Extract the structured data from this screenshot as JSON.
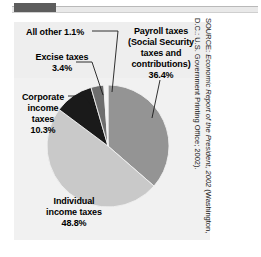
{
  "figure": {
    "panel_bg": "#f1f1f1",
    "source_line_1_prefix": "SOURCE: ",
    "source_line_1_italic": "Economic Report of the President, 2002",
    "source_line_1_suffix": " (Washington,",
    "source_line_2": "D.C.: U.S. Government Printing Office; 2002)."
  },
  "chart_data": {
    "type": "pie",
    "title": "",
    "subtitle": "",
    "xlabel": "",
    "ylabel": "",
    "legend_position": "callout-labels",
    "grid": false,
    "total": 100.0,
    "units": "percent",
    "start_angle_deg": 0,
    "direction": "clockwise",
    "categories": [
      "Payroll taxes (Social Security taxes and contributions)",
      "Individual income taxes",
      "Corporate income taxes",
      "Excise taxes",
      "All other"
    ],
    "values": [
      36.4,
      48.8,
      10.3,
      3.4,
      1.1
    ],
    "colors": [
      "#949494",
      "#c9c9c9",
      "#1a1a1a",
      "#6e6e6e",
      "#f4f4f4"
    ],
    "slices": [
      {
        "name": "payroll",
        "label_lines": [
          "Payroll taxes",
          "(Social Security",
          "taxes and",
          "contributions)",
          "36.4%"
        ],
        "value": 36.4,
        "value_text": "36.4%",
        "color": "#949494"
      },
      {
        "name": "individual",
        "label_lines": [
          "Individual",
          "income taxes",
          "48.8%"
        ],
        "value": 48.8,
        "value_text": "48.8%",
        "color": "#c9c9c9"
      },
      {
        "name": "corporate",
        "label_lines": [
          "Corporate",
          "income",
          "taxes",
          "10.3%"
        ],
        "value": 10.3,
        "value_text": "10.3%",
        "color": "#1a1a1a"
      },
      {
        "name": "excise",
        "label_lines": [
          "Excise taxes",
          "3.4%"
        ],
        "value": 3.4,
        "value_text": "3.4%",
        "color": "#6e6e6e"
      },
      {
        "name": "all-other",
        "label_lines": [
          "All other 1.1%"
        ],
        "value": 1.1,
        "value_text": "1.1%",
        "color": "#f4f4f4"
      }
    ]
  },
  "labels": {
    "all_other": "All other 1.1%",
    "excise": "Excise taxes\n3.4%",
    "corporate": "Corporate\nincome\ntaxes\n10.3%",
    "individual": "Individual\nincome taxes\n48.8%",
    "payroll": "Payroll taxes\n(Social Security\ntaxes and\ncontributions)\n36.4%"
  }
}
